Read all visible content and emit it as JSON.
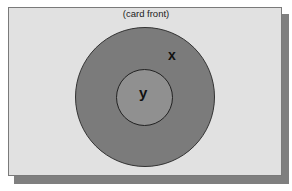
{
  "diagram": {
    "caption": "(card front)",
    "outer_region_label": "x",
    "inner_region_label": "y",
    "colors": {
      "card_background": "#e1e1e1",
      "shadow": "#7f7f7f",
      "outer_circle": "#7b7b7b",
      "inner_circle": "#909090"
    }
  }
}
